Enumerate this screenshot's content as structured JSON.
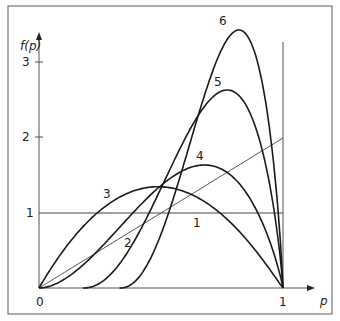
{
  "chart_data": {
    "type": "line",
    "title": "",
    "xlabel": "p",
    "ylabel": "f(p)",
    "xlim": [
      0,
      1
    ],
    "ylim": [
      0,
      3.6
    ],
    "x_ticks": [
      "0",
      "1"
    ],
    "y_ticks": [
      "1",
      "2",
      "3"
    ],
    "grid": false,
    "legend": "curves labeled inline with numbers 1-6",
    "series": [
      {
        "name": "1",
        "description": "uniform density f(p)=1",
        "x": [
          0,
          1
        ],
        "y": [
          1,
          1
        ]
      },
      {
        "name": "2",
        "description": "linear density f(p)=2p",
        "x": [
          0,
          1
        ],
        "y": [
          0,
          2
        ]
      },
      {
        "name": "3",
        "x": [
          0,
          0.25,
          0.5,
          0.75,
          1
        ],
        "y": [
          0,
          1.15,
          1.35,
          0.95,
          0
        ]
      },
      {
        "name": "4",
        "x": [
          0,
          0.25,
          0.5,
          0.69,
          0.85,
          1
        ],
        "y": [
          0,
          0.55,
          1.35,
          1.64,
          1.2,
          0
        ]
      },
      {
        "name": "5",
        "x": [
          0.18,
          0.4,
          0.6,
          0.73,
          0.85,
          1
        ],
        "y": [
          0,
          0.5,
          1.9,
          2.64,
          2.0,
          0
        ]
      },
      {
        "name": "6",
        "x": [
          0.33,
          0.5,
          0.65,
          0.75,
          0.85,
          1
        ],
        "y": [
          0,
          0.6,
          2.6,
          3.44,
          2.6,
          0
        ]
      }
    ]
  },
  "labels": {
    "yaxis": "f(p)",
    "xaxis": "p",
    "origin": "0",
    "x_one": "1",
    "y_one": "1",
    "y_two": "2",
    "y_three": "3",
    "c1": "1",
    "c2": "2",
    "c3": "3",
    "c4": "4",
    "c5": "5",
    "c6": "6"
  }
}
